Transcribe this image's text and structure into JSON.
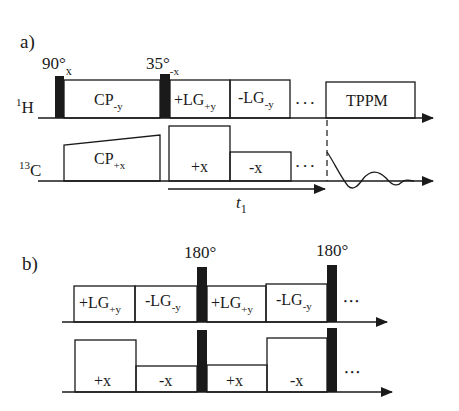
{
  "panel_a": {
    "label": "a)",
    "pulse1_label": "90°",
    "pulse1_sub": "x",
    "pulse2_label": "35°",
    "pulse2_sub": "-x",
    "h_channel": {
      "sup": "1",
      "name": "H"
    },
    "c_channel": {
      "sup": "13",
      "name": "C"
    },
    "h_blocks": [
      {
        "main": "CP",
        "sub": "-y"
      },
      {
        "main": "+LG",
        "sub": "+y"
      },
      {
        "main": "-LG",
        "sub": "-y"
      },
      {
        "main": "TPPM",
        "sub": ""
      }
    ],
    "c_blocks": [
      {
        "main": "CP",
        "sub": "+x"
      },
      {
        "main": "+x",
        "sub": ""
      },
      {
        "main": "-x",
        "sub": ""
      }
    ],
    "ellipsis": "• • •",
    "t1_label": "t",
    "t1_sub": "1"
  },
  "panel_b": {
    "label": "b)",
    "pulse_label_1": "180°",
    "pulse_label_2": "180°",
    "top_blocks": [
      {
        "main": "+LG",
        "sub": "+y"
      },
      {
        "main": "-LG",
        "sub": "-y"
      },
      {
        "main": "+LG",
        "sub": "+y"
      },
      {
        "main": "-LG",
        "sub": "-y"
      }
    ],
    "bottom_blocks": [
      {
        "main": "+x"
      },
      {
        "main": "-x"
      },
      {
        "main": "+x"
      },
      {
        "main": "-x"
      }
    ],
    "ellipsis": "• • •"
  },
  "colors": {
    "ink": "#1a1a1a",
    "background": "#ffffff"
  }
}
